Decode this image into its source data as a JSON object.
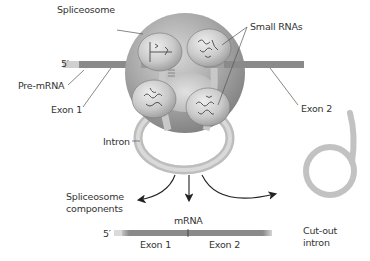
{
  "diagram": {
    "type": "biological-process",
    "topic": "RNA splicing by spliceosome",
    "labels": {
      "spliceosome": "Spliceosome",
      "small_rnas": "Small RNAs",
      "five_prime_top": "5′",
      "pre_mrna": "Pre-mRNA",
      "exon1_top": "Exon 1",
      "exon2_top": "Exon 2",
      "intron": "Intron",
      "spliceosome_components_line1": "Spliceosome",
      "spliceosome_components_line2": "components",
      "mrna": "mRNA",
      "five_prime_bottom": "5′",
      "exon1_bottom": "Exon 1",
      "exon2_bottom": "Exon 2",
      "cut_out_intron_line1": "Cut-out",
      "cut_out_intron_line2": "intron"
    },
    "colors": {
      "spliceosome_body": "#8f8f8f",
      "spliceosome_light": "#d8d8d8",
      "exon_strand": "#8a8a8a",
      "five_prime_cap": "#cfcfcf",
      "intron_strand": "#c4c4c4",
      "text": "#333333",
      "leader_lines": "#555555"
    }
  }
}
